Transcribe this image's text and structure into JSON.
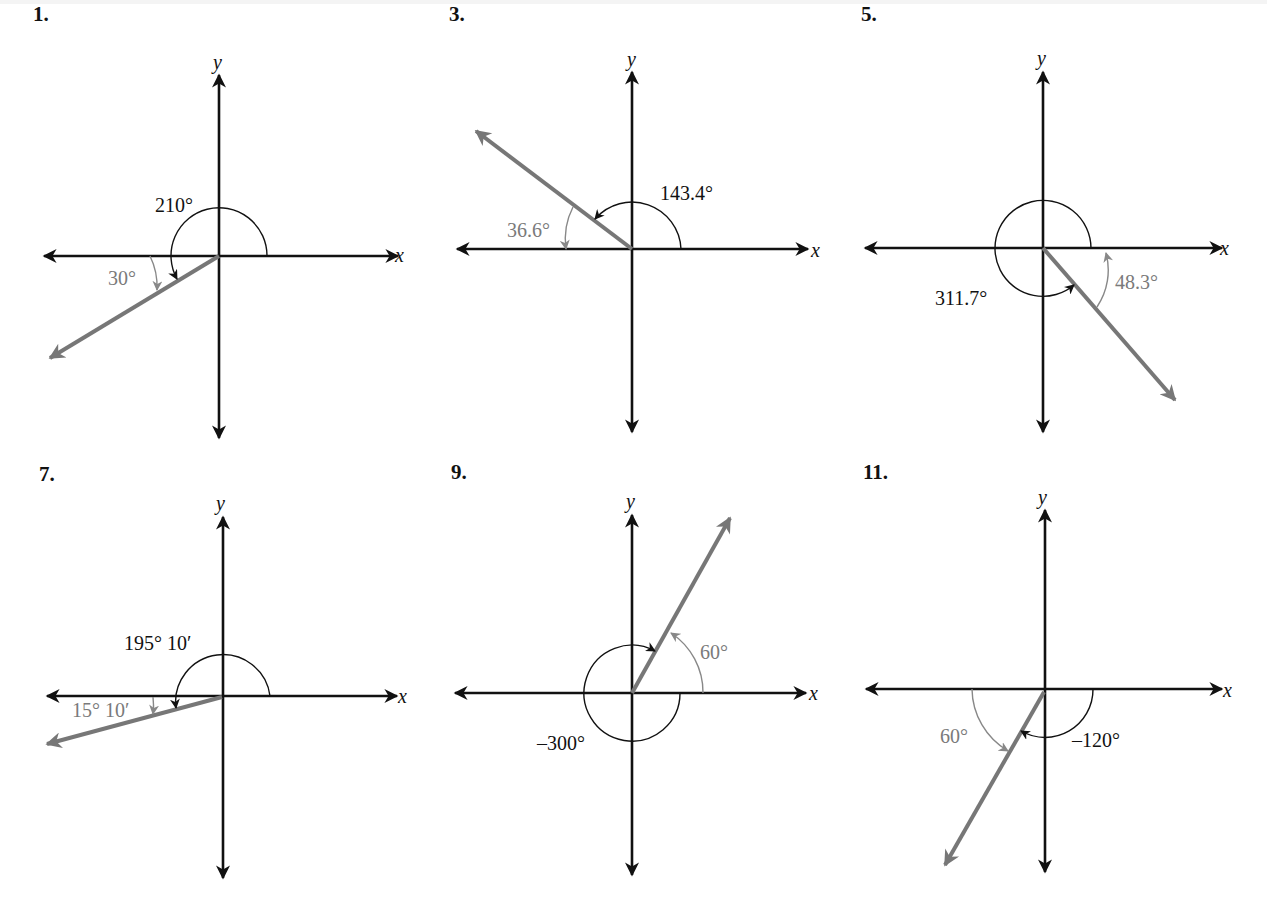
{
  "problems": [
    {
      "number": "1.",
      "x_label": "x",
      "y_label": "y",
      "angle_label": "210°",
      "reference_label": "30°",
      "angle_deg": 210,
      "reference_deg": 30
    },
    {
      "number": "3.",
      "x_label": "x",
      "y_label": "y",
      "angle_label": "143.4°",
      "reference_label": "36.6°",
      "angle_deg": 143.4,
      "reference_deg": 36.6
    },
    {
      "number": "5.",
      "x_label": "x",
      "y_label": "y",
      "angle_label": "311.7°",
      "reference_label": "48.3°",
      "angle_deg": 311.7,
      "reference_deg": 48.3
    },
    {
      "number": "7.",
      "x_label": "x",
      "y_label": "y",
      "angle_label": "195° 10′",
      "reference_label": "15° 10′",
      "angle_deg": 195.1667,
      "reference_deg": 15.1667
    },
    {
      "number": "9.",
      "x_label": "x",
      "y_label": "y",
      "angle_label": "–300°",
      "reference_label": "60°",
      "angle_deg": -300,
      "reference_deg": 60
    },
    {
      "number": "11.",
      "x_label": "x",
      "y_label": "y",
      "angle_label": "–120°",
      "reference_label": "60°",
      "angle_deg": -120,
      "reference_deg": 60
    }
  ],
  "colors": {
    "axis": "#111111",
    "terminal_ray": "#777777",
    "reference_arc": "#888888",
    "reference_text": "#7a7a7a"
  }
}
